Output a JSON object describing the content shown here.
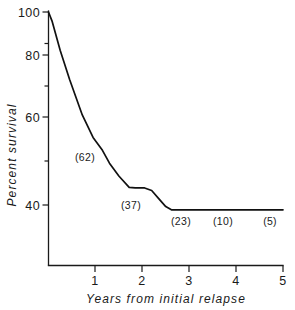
{
  "chart_data": {
    "type": "line",
    "title": "",
    "subtitle": "",
    "xlabel": "Years from initial relapse",
    "ylabel": "Percent survival",
    "xlim": [
      0,
      5
    ],
    "ylim": [
      30,
      100
    ],
    "grid": false,
    "legend": null,
    "x_ticks": [
      1,
      2,
      3,
      4,
      5
    ],
    "x_tick_labels": [
      "1",
      "2",
      "3",
      "4",
      "5"
    ],
    "x_minor_ticks": [],
    "y_ticks": [
      40,
      60,
      80,
      100
    ],
    "y_tick_labels": [
      "40",
      "60",
      "80",
      "100"
    ],
    "y_minor_ticks": [
      50,
      70,
      90
    ],
    "series": [
      {
        "name": "Percent survival",
        "x": [
          0.0,
          0.08,
          0.25,
          0.45,
          0.72,
          0.95,
          1.15,
          1.3,
          1.5,
          1.72,
          1.85,
          2.05,
          2.2,
          2.35,
          2.5,
          2.62,
          3.0,
          4.0,
          5.0
        ],
        "values": [
          100,
          97,
          88,
          79,
          68,
          61,
          57,
          53,
          49,
          45.5,
          45.3,
          45.3,
          44.5,
          42,
          39.5,
          38.5,
          38.5,
          38.5,
          38.5
        ]
      }
    ],
    "annotations": [
      {
        "label": "(62)",
        "x": 0.78,
        "y": 51.5
      },
      {
        "label": "(37)",
        "x": 1.76,
        "y": 40.2
      },
      {
        "label": "(23)",
        "x": 2.82,
        "y": 35.3
      },
      {
        "label": "(10)",
        "x": 3.72,
        "y": 35.3
      },
      {
        "label": "(5)",
        "x": 4.72,
        "y": 35.3
      }
    ]
  }
}
